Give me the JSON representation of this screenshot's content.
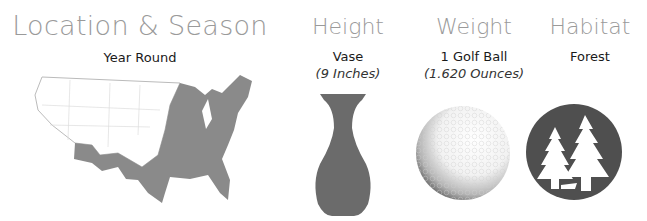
{
  "location": {
    "heading": "Location & Season",
    "season": "Year Round",
    "map_icon": "us-range-map-icon",
    "range_color": "#8a8a8a"
  },
  "height": {
    "heading": "Height",
    "comparison": "Vase",
    "value": "(9 Inches)",
    "icon": "vase-icon",
    "icon_color": "#6b6b6b"
  },
  "weight": {
    "heading": "Weight",
    "comparison": "1 Golf Ball",
    "value": "(1.620 Ounces)",
    "icon": "golf-ball-icon"
  },
  "habitat": {
    "heading": "Habitat",
    "value": "Forest",
    "icon": "forest-icon",
    "icon_color": "#4f4f4f"
  }
}
